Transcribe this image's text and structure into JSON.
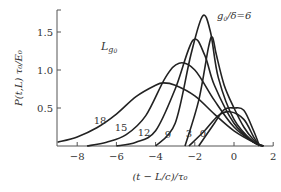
{
  "chart_data": {
    "type": "line",
    "title": "",
    "xlabel": "(t - L/c)/τ0",
    "ylabel": "P(t,L) τ0/E0",
    "xlim": [
      -9,
      2
    ],
    "ylim": [
      0,
      1.9
    ],
    "x_ticks": [
      "-8",
      "-6",
      "-4",
      "-2",
      "0",
      "2"
    ],
    "y_ticks": [
      "0.5",
      "1.0",
      "1.5"
    ],
    "grid": false,
    "annotations": {
      "corner_label": "L g0",
      "param_label": "g0/δ=6"
    },
    "series": [
      {
        "name": "18",
        "label": "18",
        "peak_x": -3.6,
        "peak_y": 0.83,
        "points": [
          [
            -9,
            0.05
          ],
          [
            -8,
            0.12
          ],
          [
            -7,
            0.24
          ],
          [
            -6,
            0.42
          ],
          [
            -5,
            0.65
          ],
          [
            -4,
            0.8
          ],
          [
            -3.6,
            0.83
          ],
          [
            -3,
            0.8
          ],
          [
            -2,
            0.66
          ],
          [
            -1,
            0.42
          ],
          [
            0,
            0.2
          ],
          [
            1,
            0.05
          ],
          [
            1.5,
            0
          ]
        ]
      },
      {
        "name": "15",
        "label": "15",
        "peak_x": -2.8,
        "peak_y": 1.09,
        "points": [
          [
            -7.5,
            0
          ],
          [
            -6.5,
            0.05
          ],
          [
            -5.5,
            0.15
          ],
          [
            -4.5,
            0.4
          ],
          [
            -3.5,
            0.9
          ],
          [
            -2.8,
            1.09
          ],
          [
            -2,
            1.0
          ],
          [
            -1,
            0.6
          ],
          [
            0,
            0.25
          ],
          [
            1,
            0.05
          ],
          [
            1.5,
            0
          ]
        ]
      },
      {
        "name": "12",
        "label": "12",
        "peak_x": -2.1,
        "peak_y": 1.39,
        "points": [
          [
            -6,
            0
          ],
          [
            -5,
            0.05
          ],
          [
            -4,
            0.2
          ],
          [
            -3,
            0.75
          ],
          [
            -2.1,
            1.39
          ],
          [
            -1.5,
            1.2
          ],
          [
            -1,
            0.8
          ],
          [
            0,
            0.3
          ],
          [
            1,
            0.05
          ],
          [
            1.5,
            0
          ]
        ]
      },
      {
        "name": "9",
        "label": "9",
        "peak_x": -1.6,
        "peak_y": 1.71,
        "points": [
          [
            -4,
            0
          ],
          [
            -3,
            0.3
          ],
          [
            -2.2,
            1.2
          ],
          [
            -1.6,
            1.71
          ],
          [
            -1.2,
            1.5
          ],
          [
            -0.8,
            0.9
          ],
          [
            0,
            0.35
          ],
          [
            1,
            0.05
          ],
          [
            1.5,
            0
          ]
        ]
      },
      {
        "name": "6",
        "label": "g0/δ=6",
        "peak_x": -1.1,
        "peak_y": 1.43,
        "points": [
          [
            -2.5,
            0
          ],
          [
            -1.8,
            0.6
          ],
          [
            -1.3,
            1.3
          ],
          [
            -1.1,
            1.43
          ],
          [
            -0.9,
            1.2
          ],
          [
            -0.5,
            0.8
          ],
          [
            0,
            0.5
          ],
          [
            0.5,
            0.25
          ],
          [
            1,
            0.08
          ],
          [
            1.4,
            0
          ]
        ]
      },
      {
        "name": "3",
        "label": "3",
        "peak_x": -0.2,
        "peak_y": 0.45,
        "points": [
          [
            -2.3,
            0
          ],
          [
            -1.5,
            0.2
          ],
          [
            -0.8,
            0.4
          ],
          [
            -0.2,
            0.45
          ],
          [
            0.5,
            0.35
          ],
          [
            1,
            0.12
          ],
          [
            1.3,
            0
          ]
        ]
      },
      {
        "name": "0",
        "label": "0",
        "peak_x": 0.0,
        "peak_y": 0.5,
        "points": [
          [
            -1.8,
            0
          ],
          [
            -1,
            0.3
          ],
          [
            -0.5,
            0.48
          ],
          [
            0,
            0.5
          ],
          [
            0.5,
            0.47
          ],
          [
            1,
            0.2
          ],
          [
            1.3,
            0
          ]
        ]
      }
    ]
  }
}
